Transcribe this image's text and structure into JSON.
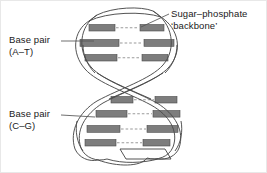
{
  "figure": {
    "background_color": "#ffffff",
    "width": 267,
    "height": 173
  },
  "labels": {
    "sugar_phosphate": {
      "line1": "Sugar–phosphate",
      "line2": "‘backbone’"
    },
    "base_pair_at": {
      "line1": "Base pair",
      "line2": "(A–T)"
    },
    "base_pair_cg": {
      "line1": "Base pair",
      "line2": "(C–G)"
    }
  },
  "colors": {
    "outline": "#4a4a4a",
    "base_bar": "#808080",
    "base_bar_dark": "#6b6b6b",
    "hydrogen_bond": "#b0b0b0",
    "text": "#1a1a1a",
    "leader_line": "#555555",
    "background": "#ffffff",
    "frame": "#e8e8e8"
  },
  "structure": {
    "strand_count": 2,
    "turns": 2,
    "base_pair_rungs": [
      {
        "id": "rung-1",
        "section": "upper",
        "y": 27,
        "left_start": 88,
        "left_end": 113,
        "gap_start": 113,
        "gap_end": 140,
        "right_start": 140,
        "right_end": 162
      },
      {
        "id": "rung-2",
        "section": "upper",
        "y": 42,
        "left_start": 80,
        "left_end": 118,
        "gap_start": 118,
        "gap_end": 143,
        "right_start": 143,
        "right_end": 172
      },
      {
        "id": "rung-3",
        "section": "upper",
        "y": 57,
        "left_start": 84,
        "left_end": 115,
        "gap_start": 115,
        "gap_end": 141,
        "right_start": 141,
        "right_end": 166
      },
      {
        "id": "rung-4",
        "section": "lower",
        "y": 99,
        "left_start": 110,
        "left_end": 130,
        "gap_start": 130,
        "gap_end": 155,
        "right_start": 155,
        "right_end": 175
      },
      {
        "id": "lower-rung-2",
        "section": "lower",
        "y": 113,
        "left_start": 94,
        "left_end": 125,
        "gap_start": 125,
        "gap_end": 152,
        "right_start": 152,
        "right_end": 178
      },
      {
        "id": "lower-rung-3",
        "section": "lower",
        "y": 128,
        "left_start": 86,
        "left_end": 118,
        "gap_start": 118,
        "gap_end": 146,
        "right_start": 146,
        "right_end": 176
      },
      {
        "id": "lower-rung-4",
        "section": "lower",
        "y": 142,
        "left_start": 84,
        "left_end": 114,
        "gap_start": 114,
        "gap_end": 142,
        "right_start": 142,
        "right_end": 168
      }
    ],
    "leader_lines": [
      {
        "id": "leader-sugar-phosphate",
        "from_x": 168,
        "from_y": 14,
        "to_x": 142,
        "to_y": 27
      },
      {
        "id": "leader-base-pair-at",
        "from_x": 62,
        "from_y": 40,
        "to_x": 92,
        "to_y": 40
      },
      {
        "id": "leader-base-pair-cg",
        "from_x": 62,
        "from_y": 114,
        "to_x": 96,
        "to_y": 116
      }
    ]
  }
}
